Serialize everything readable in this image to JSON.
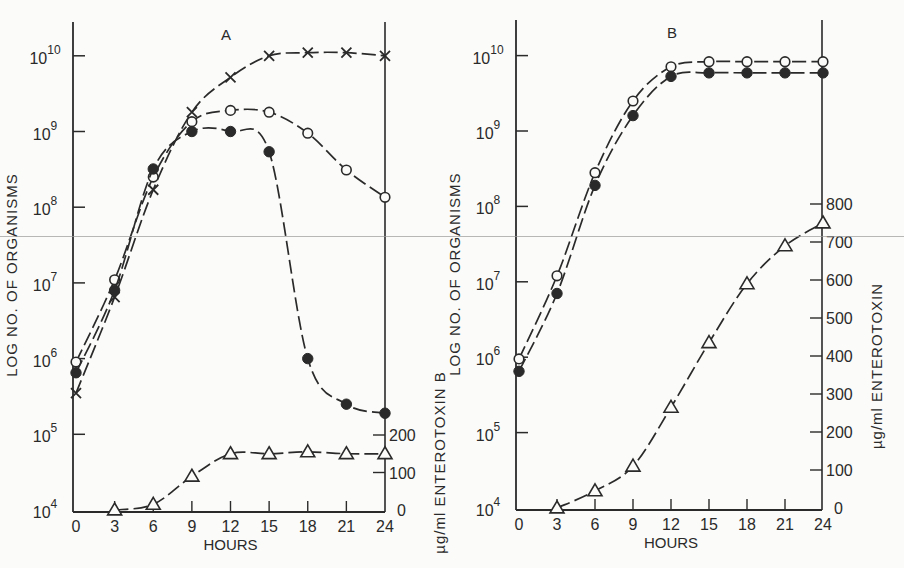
{
  "chart_data": [
    {
      "panel": "A",
      "type": "line",
      "title": "A",
      "xlabel": "HOURS",
      "ylabel": "LOG NO. OF ORGANISMS",
      "y2label": "µg/ml ENTEROTOXIN B",
      "x": [
        0,
        3,
        6,
        9,
        12,
        15,
        18,
        21,
        24
      ],
      "x_ticks": [
        "0",
        "3",
        "6",
        "9",
        "12",
        "15",
        "18",
        "21",
        "24"
      ],
      "y_scale": "log",
      "ylim": [
        10000,
        10000000000
      ],
      "y_ticks": [
        {
          "base": "10",
          "exp": "4",
          "value": 10000
        },
        {
          "base": "10",
          "exp": "5",
          "value": 100000
        },
        {
          "base": "10",
          "exp": "6",
          "value": 1000000
        },
        {
          "base": "10",
          "exp": "7",
          "value": 10000000
        },
        {
          "base": "10",
          "exp": "8",
          "value": 100000000
        },
        {
          "base": "10",
          "exp": "9",
          "value": 1000000000
        },
        {
          "base": "10",
          "exp": "10",
          "value": 10000000000
        }
      ],
      "y2lim": [
        0,
        200
      ],
      "y2_ticks": [
        "0",
        "100",
        "200"
      ],
      "grid": false,
      "legend": "none (series identified by marker)",
      "series": [
        {
          "name": "cross-marker count",
          "marker": "x",
          "axis": "left",
          "values": [
            350000,
            6500000,
            170000000,
            1800000000,
            5200000000,
            10000000000,
            11000000000,
            11000000000,
            10000000000
          ]
        },
        {
          "name": "open-circle count",
          "marker": "open-circle",
          "axis": "left",
          "values": [
            900000,
            11000000,
            250000000,
            1350000000,
            1900000000,
            1800000000,
            950000000,
            310000000,
            135000000
          ]
        },
        {
          "name": "filled-circle count",
          "marker": "filled-circle",
          "axis": "left",
          "values": [
            650000,
            8000000,
            320000000,
            1000000000,
            1000000000,
            540000000,
            1000000,
            250000,
            190000
          ]
        },
        {
          "name": "enterotoxin B (µg/ml)",
          "marker": "open-triangle",
          "axis": "right",
          "x": [
            3,
            6,
            9,
            12,
            15,
            18,
            21,
            24
          ],
          "values": [
            0,
            15,
            90,
            150,
            150,
            155,
            150,
            150
          ]
        }
      ]
    },
    {
      "panel": "B",
      "type": "line",
      "title": "B",
      "xlabel": "HOURS",
      "ylabel": "LOG NO. OF ORGANISMS",
      "y2label": "µg/ml ENTEROTOXIN",
      "x": [
        0,
        3,
        6,
        9,
        12,
        15,
        18,
        21,
        24
      ],
      "x_ticks": [
        "0",
        "3",
        "6",
        "9",
        "12",
        "15",
        "18",
        "21",
        "24"
      ],
      "y_scale": "log",
      "ylim": [
        10000,
        10000000000
      ],
      "y_ticks": [
        {
          "base": "10",
          "exp": "4",
          "value": 10000
        },
        {
          "base": "10",
          "exp": "5",
          "value": 100000
        },
        {
          "base": "10",
          "exp": "6",
          "value": 1000000
        },
        {
          "base": "10",
          "exp": "7",
          "value": 10000000
        },
        {
          "base": "10",
          "exp": "8",
          "value": 100000000
        },
        {
          "base": "10",
          "exp": "9",
          "value": 1000000000
        },
        {
          "base": "10",
          "exp": "10",
          "value": 10000000000
        }
      ],
      "y2lim": [
        0,
        800
      ],
      "y2_ticks": [
        "0",
        "100",
        "200",
        "300",
        "400",
        "500",
        "600",
        "700",
        "800"
      ],
      "grid": false,
      "legend": "none (series identified by marker)",
      "series": [
        {
          "name": "open-circle count",
          "marker": "open-circle",
          "axis": "left",
          "values": [
            950000,
            12000000,
            280000000,
            2500000000,
            7100000000,
            8300000000,
            8300000000,
            8300000000,
            8300000000
          ]
        },
        {
          "name": "filled-circle count",
          "marker": "filled-circle",
          "axis": "left",
          "values": [
            650000,
            7000000,
            190000000,
            1600000000,
            5300000000,
            5900000000,
            5900000000,
            5900000000,
            5900000000
          ]
        },
        {
          "name": "enterotoxin (µg/ml)",
          "marker": "open-triangle",
          "axis": "right",
          "x": [
            3,
            6,
            9,
            12,
            15,
            18,
            21,
            24
          ],
          "values": [
            0,
            45,
            110,
            265,
            435,
            590,
            690,
            750
          ]
        }
      ]
    }
  ],
  "layout": {
    "panels": [
      {
        "x0": 76,
        "x1": 385,
        "axis_x": 73,
        "right_axis_x": 385,
        "y_top_decade": 56,
        "y_base": 510,
        "px_per_decade": 75.7,
        "right_top_y": 435,
        "right_max": 200,
        "title_x": 226,
        "title_y": 40,
        "frame_top": 22
      },
      {
        "x0": 519,
        "x1": 823,
        "axis_x": 516,
        "right_axis_x": 822,
        "y_top_decade": 56,
        "y_base": 508,
        "px_per_decade": 75.4,
        "right_top_y": 204,
        "right_max": 800,
        "title_x": 672,
        "title_y": 38,
        "frame_top": 20
      }
    ]
  }
}
